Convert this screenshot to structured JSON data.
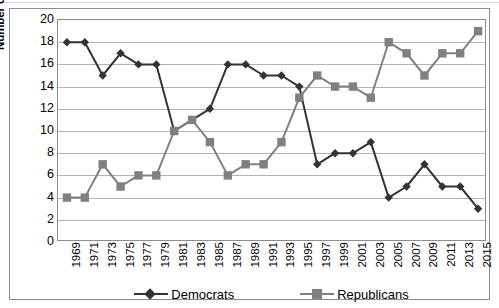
{
  "chart_data": {
    "type": "line",
    "title": "",
    "xlabel": "",
    "ylabel": "Number of Southern Senate seats",
    "ylim": [
      0,
      20
    ],
    "ytick_step": 2,
    "yticks": [
      20,
      18,
      16,
      14,
      12,
      10,
      8,
      6,
      4,
      2,
      0
    ],
    "grid": true,
    "legend_position": "bottom",
    "categories": [
      "1969",
      "1971",
      "1973",
      "1975",
      "1977",
      "1979",
      "1981",
      "1983",
      "1985",
      "1987",
      "1989",
      "1991",
      "1993",
      "1995",
      "1997",
      "1999",
      "2001",
      "2003",
      "2005",
      "2007",
      "2009",
      "2011",
      "2013",
      "2015"
    ],
    "series": [
      {
        "name": "Democrats",
        "marker": "diamond",
        "color": "#333333",
        "values": [
          18,
          18,
          15,
          17,
          16,
          16,
          10,
          11,
          12,
          16,
          16,
          15,
          15,
          14,
          7,
          8,
          8,
          9,
          4,
          5,
          7,
          5,
          5,
          3
        ]
      },
      {
        "name": "Republicans",
        "marker": "square",
        "color": "#808080",
        "values": [
          4,
          4,
          7,
          5,
          6,
          6,
          10,
          11,
          9,
          6,
          7,
          7,
          9,
          13,
          15,
          14,
          14,
          13,
          18,
          17,
          15,
          17,
          17,
          19
        ]
      }
    ]
  },
  "legend": {
    "entries": [
      {
        "label": "Democrats"
      },
      {
        "label": "Republicans"
      }
    ]
  },
  "colors": {
    "democrat": "#333333",
    "republican": "#808080",
    "gridline": "#b3b3b3",
    "frame": "#8d8d8d",
    "background": "#ffffff"
  }
}
